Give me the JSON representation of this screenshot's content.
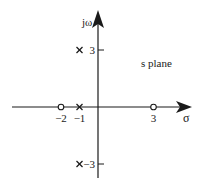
{
  "diagram": {
    "title": "s plane",
    "axes": {
      "real_label": "σ",
      "imag_label": "jω"
    },
    "tick_labels": {
      "real": [
        {
          "value": -2,
          "label": "−2"
        },
        {
          "value": -1,
          "label": "−1"
        },
        {
          "value": 3,
          "label": "3"
        }
      ],
      "imag": [
        {
          "value": 3,
          "label": "3"
        },
        {
          "value": -3,
          "label": "−3"
        }
      ]
    },
    "poles": [
      {
        "re": -1,
        "im": 3
      },
      {
        "re": -1,
        "im": 0
      },
      {
        "re": -1,
        "im": -3
      }
    ],
    "zeros": [
      {
        "re": -2,
        "im": 0
      },
      {
        "re": 3,
        "im": 0
      }
    ],
    "colors": {
      "ink": "#1a1a1a",
      "background": "#ffffff"
    }
  }
}
